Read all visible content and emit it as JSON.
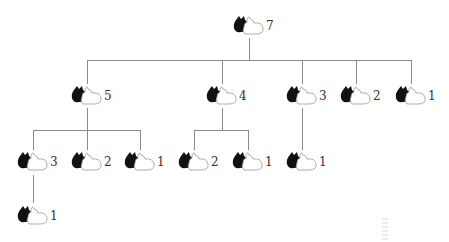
{
  "diagram": {
    "type": "tree",
    "icon": "rabbit-pair-icon",
    "colors": {
      "line": "#8a8a8a",
      "rabbit_dark": "#111111",
      "rabbit_light": "#ffffff",
      "label": "#333333"
    },
    "nodes": [
      {
        "id": "n7",
        "label": "7",
        "x": 249,
        "y": 27
      },
      {
        "id": "n5",
        "label": "5",
        "x": 87,
        "y": 97
      },
      {
        "id": "n4",
        "label": "4",
        "x": 222,
        "y": 97
      },
      {
        "id": "n3",
        "label": "3",
        "x": 302,
        "y": 97
      },
      {
        "id": "n2",
        "label": "2",
        "x": 356,
        "y": 97
      },
      {
        "id": "n1",
        "label": "1",
        "x": 411,
        "y": 97
      },
      {
        "id": "n5a",
        "label": "3",
        "x": 33,
        "y": 163
      },
      {
        "id": "n5b",
        "label": "2",
        "x": 87,
        "y": 163
      },
      {
        "id": "n5c",
        "label": "1",
        "x": 140,
        "y": 163
      },
      {
        "id": "n4a",
        "label": "2",
        "x": 194,
        "y": 163
      },
      {
        "id": "n4b",
        "label": "1",
        "x": 248,
        "y": 163
      },
      {
        "id": "n3a",
        "label": "1",
        "x": 302,
        "y": 163
      },
      {
        "id": "n5aa",
        "label": "1",
        "x": 33,
        "y": 217
      }
    ],
    "edges": [
      [
        "n7",
        "n5"
      ],
      [
        "n7",
        "n4"
      ],
      [
        "n7",
        "n3"
      ],
      [
        "n7",
        "n2"
      ],
      [
        "n7",
        "n1"
      ],
      [
        "n5",
        "n5a"
      ],
      [
        "n5",
        "n5b"
      ],
      [
        "n5",
        "n5c"
      ],
      [
        "n4",
        "n4a"
      ],
      [
        "n4",
        "n4b"
      ],
      [
        "n3",
        "n3a"
      ],
      [
        "n5a",
        "n5aa"
      ]
    ]
  }
}
